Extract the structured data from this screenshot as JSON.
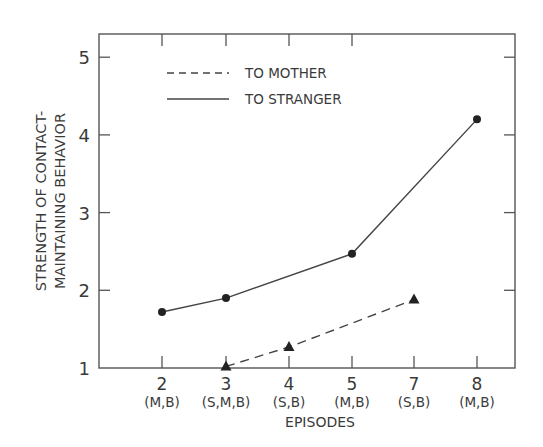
{
  "chart_data": {
    "type": "line",
    "title": "",
    "xlabel": "EPISODES",
    "ylabel_lines": [
      "STRENGTH OF CONTACT-",
      "MAINTAINING BEHAVIOR"
    ],
    "ylabel": "STRENGTH OF CONTACT-MAINTAINING BEHAVIOR",
    "ylim": [
      1,
      5.3
    ],
    "yticks": [
      1,
      2,
      3,
      4,
      5
    ],
    "categories": [
      {
        "episode": "2",
        "label": "(M,B)"
      },
      {
        "episode": "3",
        "label": "(S,M,B)"
      },
      {
        "episode": "4",
        "label": "(S,B)"
      },
      {
        "episode": "5",
        "label": "(M,B)"
      },
      {
        "episode": "7",
        "label": "(S,B)"
      },
      {
        "episode": "8",
        "label": "(M,B)"
      }
    ],
    "series": [
      {
        "name": "TO MOTHER",
        "style": "dashed",
        "marker": "triangle",
        "points": [
          {
            "episode": "3",
            "value": 1.02
          },
          {
            "episode": "4",
            "value": 1.27
          },
          {
            "episode": "7",
            "value": 1.88
          }
        ]
      },
      {
        "name": "TO STRANGER",
        "style": "solid",
        "marker": "circle",
        "points": [
          {
            "episode": "2",
            "value": 1.72
          },
          {
            "episode": "3",
            "value": 1.9
          },
          {
            "episode": "5",
            "value": 2.47
          },
          {
            "episode": "8",
            "value": 4.2
          }
        ]
      }
    ],
    "legend": {
      "position": "upper-left-inside",
      "entries": [
        {
          "label": "TO MOTHER",
          "style": "dashed"
        },
        {
          "label": "TO STRANGER",
          "style": "solid"
        }
      ]
    },
    "grid": false
  }
}
